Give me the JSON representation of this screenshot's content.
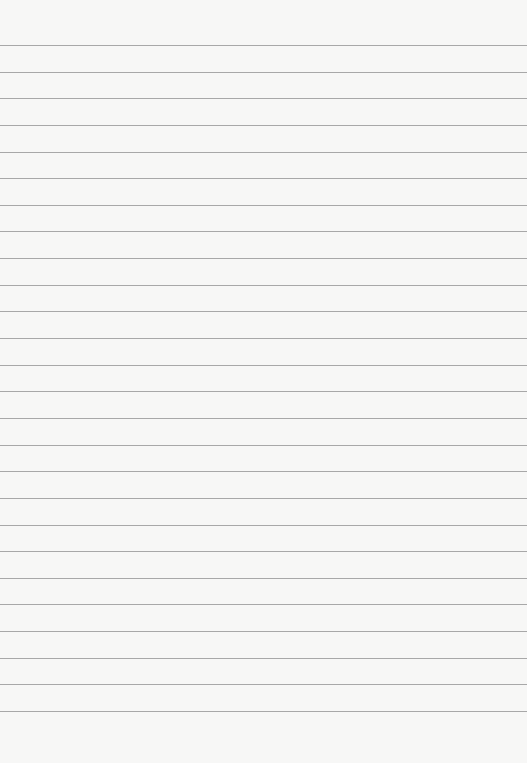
{
  "paper": {
    "type": "lined-paper",
    "line_count": 26,
    "first_line_y": 45,
    "line_spacing": 26.64,
    "line_color": "#9a9a9a",
    "background_color": "#f7f7f6"
  }
}
